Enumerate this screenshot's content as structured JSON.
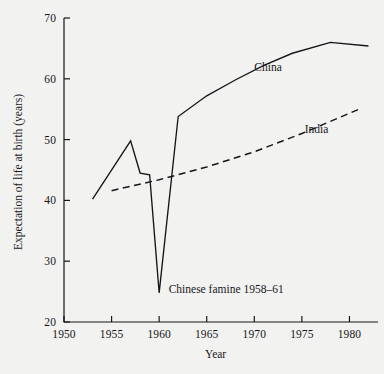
{
  "chart_data": {
    "type": "line",
    "title": "",
    "xlabel": "Year",
    "ylabel": "Expectation of life at birth (years)",
    "xlim": [
      1950,
      1983
    ],
    "ylim": [
      20,
      70
    ],
    "xticks": [
      1950,
      1955,
      1960,
      1965,
      1970,
      1975,
      1980
    ],
    "xtick_labels": [
      "1950",
      "1955",
      "1960",
      "1965",
      "1970",
      "1975",
      "1980"
    ],
    "yticks": [
      20,
      30,
      40,
      50,
      60,
      70
    ],
    "ytick_labels": [
      "20",
      "30",
      "40",
      "50",
      "60",
      "70"
    ],
    "grid": false,
    "legend_position": "inline-labels",
    "series": [
      {
        "name": "China",
        "style": "solid",
        "label_text": "China",
        "label_x": 1970.0,
        "label_y": 61.7,
        "x": [
          1953,
          1957,
          1958,
          1959,
          1960,
          1962,
          1965,
          1968,
          1971,
          1974,
          1978,
          1982
        ],
        "y": [
          40.2,
          49.8,
          44.5,
          44.2,
          24.8,
          53.8,
          57.2,
          59.8,
          62.2,
          64.2,
          66.0,
          65.4
        ]
      },
      {
        "name": "India",
        "style": "dashed",
        "label_text": "India",
        "label_x": 1975.3,
        "label_y": 51.6,
        "x": [
          1955,
          1960,
          1965,
          1970,
          1975,
          1981
        ],
        "y": [
          41.6,
          43.4,
          45.5,
          48.0,
          51.0,
          55.0
        ]
      }
    ],
    "annotations": [
      {
        "text": "Chinese famine 1958–61",
        "x": 1961.0,
        "y": 25.2
      }
    ]
  },
  "axis": {
    "x_title": "Year",
    "y_title": "Expectation of life at birth (years)"
  },
  "colors": {
    "background": "#f2f2f0",
    "ink": "#16161a",
    "china_line": "#16161a",
    "india_line": "#16161a"
  }
}
